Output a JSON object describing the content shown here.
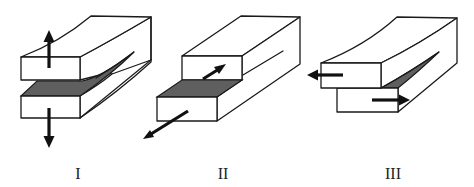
{
  "figure": {
    "type": "fracture-modes-diagram",
    "colors": {
      "outline": "#1a1a1a",
      "crack_face": "#5f5f5f",
      "block_fill": "#ffffff",
      "arrow": "#111111"
    },
    "modes": [
      {
        "label": "I",
        "description": "opening mode — arrows pull upper and lower faces apart vertically"
      },
      {
        "label": "II",
        "description": "sliding mode — arrows shear faces along crack propagation direction"
      },
      {
        "label": "III",
        "description": "tearing mode — arrows shear faces sideways, out of plane"
      }
    ]
  }
}
